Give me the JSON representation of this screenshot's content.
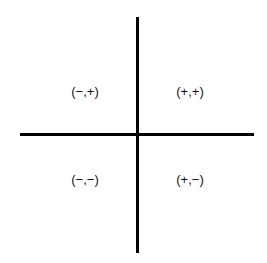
{
  "diagram": {
    "type": "coordinate-plane-quadrant-signs",
    "quadrants": {
      "top_left": "(−,+)",
      "top_right": "(+,+)",
      "bottom_left": "(−,−)",
      "bottom_right": "(+,−)"
    },
    "colors": {
      "axis": "#000000",
      "background": "#ffffff",
      "text": "#111111"
    }
  }
}
